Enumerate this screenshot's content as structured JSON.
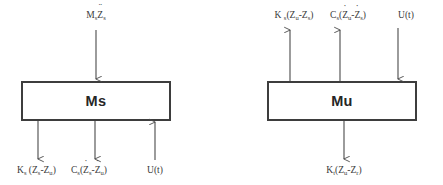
{
  "diagram": {
    "background_color": "#ffffff",
    "stroke_color": "#4a4a4a",
    "text_color": "#2b2b2b",
    "blocks": [
      {
        "id": "sprung-mass",
        "label": "Ms",
        "x": 22,
        "y": 82,
        "width": 148,
        "height": 38
      },
      {
        "id": "unsprung-mass",
        "label": "Mu",
        "x": 268,
        "y": 82,
        "width": 148,
        "height": 38
      }
    ],
    "labels": {
      "ms_input_top": {
        "prefix": "M",
        "sub1": "s",
        "var": "Z",
        "sub2": "s",
        "accent": "double-dot",
        "plain": "Ms Z̈s"
      },
      "ms_out_spring": {
        "plain": "Ks (Zs-Zu)",
        "parts": {
          "k": "K",
          "ksub": "s",
          "open": " (Z",
          "z1sub": "s",
          "minus": "-Z",
          "z2sub": "u",
          "close": ")"
        }
      },
      "ms_out_damper": {
        "plain": "Cs(Żs-Żu)",
        "parts": {
          "c": "C",
          "csub": "s",
          "open": "(",
          "z1": "Z",
          "z1sub": "s",
          "minus": "-",
          "z2": "Z",
          "z2sub": "u",
          "close": ")"
        }
      },
      "ms_actuator": {
        "plain": "U(t)"
      },
      "mu_out_spring": {
        "plain": "K s(Zu-Zs)",
        "parts": {
          "k": "K",
          "ksub": "s",
          "open": "(Z",
          "z1sub": "u",
          "minus": "-Z",
          "z2sub": "s",
          "close": ")"
        }
      },
      "mu_out_damper": {
        "plain": "Cs(Żu-Żs)",
        "parts": {
          "c": "C",
          "csub": "s",
          "open": "(",
          "z1": "Z",
          "z1sub": "u",
          "minus": "-",
          "z2": "Z",
          "z2sub": "s",
          "close": ")"
        }
      },
      "mu_actuator": {
        "plain": "U(t)"
      },
      "mu_out_tire": {
        "plain": "Kt(Zu-Zr)",
        "parts": {
          "k": "K",
          "ksub": "t",
          "open": "(Z",
          "z1sub": "u",
          "minus": "-Z",
          "z2sub": "r",
          "close": ")"
        }
      }
    },
    "arrows": [
      {
        "id": "arrow-ms-input",
        "x": 96,
        "from_y": 32,
        "to_y": 80,
        "direction": "down"
      },
      {
        "id": "arrow-ms-spring-out",
        "x": 38,
        "from_y": 122,
        "to_y": 160,
        "direction": "down"
      },
      {
        "id": "arrow-ms-damper-out",
        "x": 95,
        "from_y": 122,
        "to_y": 160,
        "direction": "down"
      },
      {
        "id": "arrow-ms-actuator",
        "x": 155,
        "from_y": 160,
        "to_y": 122,
        "direction": "up"
      },
      {
        "id": "arrow-mu-spring-out",
        "x": 290,
        "from_y": 80,
        "to_y": 30,
        "direction": "up"
      },
      {
        "id": "arrow-mu-damper-out",
        "x": 340,
        "from_y": 80,
        "to_y": 30,
        "direction": "up"
      },
      {
        "id": "arrow-mu-actuator",
        "x": 398,
        "from_y": 30,
        "to_y": 80,
        "direction": "down"
      },
      {
        "id": "arrow-mu-tire-out",
        "x": 344,
        "from_y": 122,
        "to_y": 160,
        "direction": "down"
      }
    ]
  }
}
